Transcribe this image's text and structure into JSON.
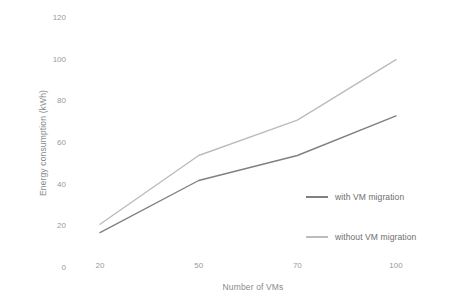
{
  "chart_data": {
    "type": "line",
    "title": "",
    "xlabel": "Number of VMs",
    "ylabel": "Energy consumption (kWh)",
    "categories": [
      "20",
      "50",
      "70",
      "100"
    ],
    "yticks": [
      "0",
      "20",
      "40",
      "60",
      "80",
      "100",
      "120"
    ],
    "ylim": [
      0,
      120
    ],
    "grid": false,
    "legend_position": "right-inside",
    "series": [
      {
        "name": "with VM migration",
        "values": [
          17,
          42,
          54,
          73
        ],
        "color": "#808080"
      },
      {
        "name": "without VM migration",
        "values": [
          21,
          54,
          71,
          100
        ],
        "color": "#bcbcbc"
      }
    ]
  }
}
